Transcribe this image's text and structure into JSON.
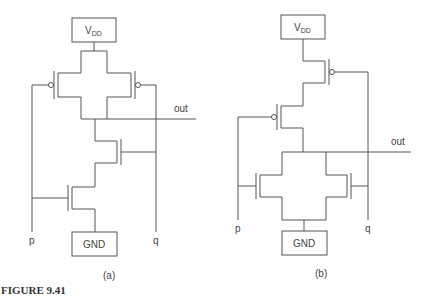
{
  "figure": {
    "caption": "FIGURE 9.41",
    "subfigures": [
      {
        "label": "(a)",
        "supply": {
          "main": "V",
          "sub": "DD"
        },
        "ground": "GND",
        "output": "out",
        "inputs": [
          "p",
          "q"
        ],
        "description": "Two parallel pMOS pull-up, two series nMOS pull-down (NAND gate)"
      },
      {
        "label": "(b)",
        "supply": {
          "main": "V",
          "sub": "DD"
        },
        "ground": "GND",
        "output": "out",
        "inputs": [
          "p",
          "q"
        ],
        "description": "Two series pMOS pull-up, two parallel nMOS pull-down (NOR gate)"
      }
    ]
  }
}
